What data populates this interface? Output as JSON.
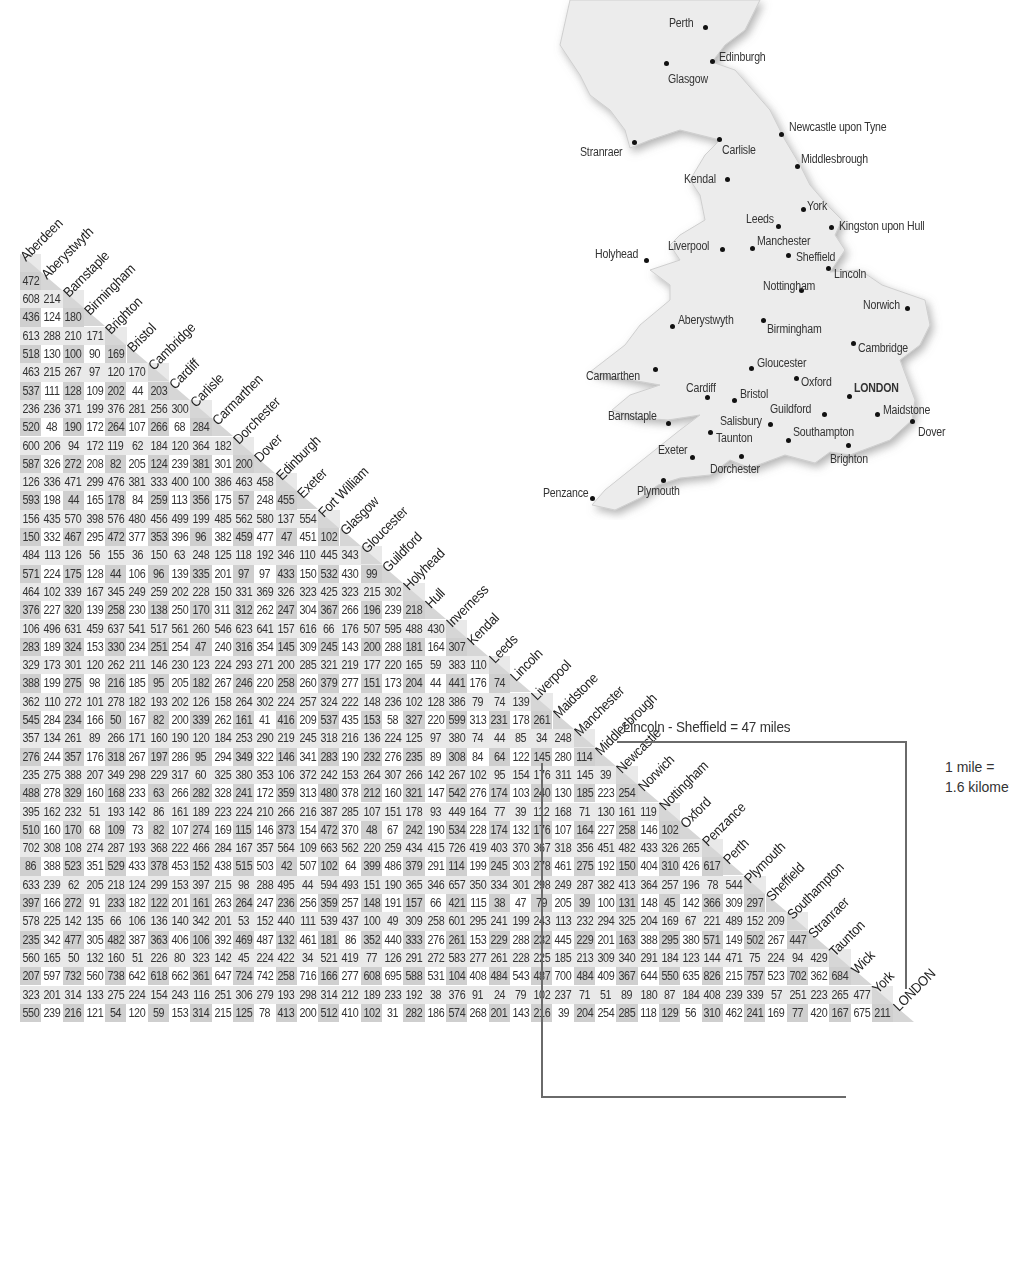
{
  "map": {
    "towns": [
      {
        "name": "Perth",
        "x": 669,
        "y": 16,
        "dx": 705,
        "dy": 27
      },
      {
        "name": "Edinburgh",
        "x": 719,
        "y": 50,
        "dx": 712,
        "dy": 61
      },
      {
        "name": "Glasgow",
        "x": 668,
        "y": 72,
        "dx": 666,
        "dy": 63
      },
      {
        "name": "Newcastle upon Tyne",
        "x": 789,
        "y": 120,
        "dx": 781,
        "dy": 134
      },
      {
        "name": "Stranraer",
        "x": 580,
        "y": 145,
        "dx": 634,
        "dy": 142
      },
      {
        "name": "Carlisle",
        "x": 722,
        "y": 143,
        "dx": 719,
        "dy": 139
      },
      {
        "name": "Middlesbrough",
        "x": 801,
        "y": 152,
        "dx": 797,
        "dy": 166
      },
      {
        "name": "Kendal",
        "x": 684,
        "y": 172,
        "dx": 727,
        "dy": 179
      },
      {
        "name": "York",
        "x": 807,
        "y": 199,
        "dx": 803,
        "dy": 209
      },
      {
        "name": "Leeds",
        "x": 746,
        "y": 212,
        "dx": 778,
        "dy": 226
      },
      {
        "name": "Kingston upon Hull",
        "x": 839,
        "y": 219,
        "dx": 831,
        "dy": 227
      },
      {
        "name": "Manchester",
        "x": 757,
        "y": 234,
        "dx": 752,
        "dy": 248
      },
      {
        "name": "Liverpool",
        "x": 668,
        "y": 239,
        "dx": 722,
        "dy": 249
      },
      {
        "name": "Holyhead",
        "x": 595,
        "y": 247,
        "dx": 646,
        "dy": 260
      },
      {
        "name": "Sheffield",
        "x": 796,
        "y": 250,
        "dx": 788,
        "dy": 255
      },
      {
        "name": "Lincoln",
        "x": 834,
        "y": 267,
        "dx": 828,
        "dy": 268
      },
      {
        "name": "Nottingham",
        "x": 763,
        "y": 279,
        "dx": 801,
        "dy": 290
      },
      {
        "name": "Norwich",
        "x": 863,
        "y": 298,
        "dx": 907,
        "dy": 308
      },
      {
        "name": "Aberystwyth",
        "x": 678,
        "y": 313,
        "dx": 672,
        "dy": 326
      },
      {
        "name": "Birmingham",
        "x": 767,
        "y": 322,
        "dx": 763,
        "dy": 320
      },
      {
        "name": "Cambridge",
        "x": 858,
        "y": 341,
        "dx": 853,
        "dy": 343
      },
      {
        "name": "Gloucester",
        "x": 757,
        "y": 356,
        "dx": 751,
        "dy": 368
      },
      {
        "name": "Carmarthen",
        "x": 586,
        "y": 369,
        "dx": 655,
        "dy": 369
      },
      {
        "name": "Oxford",
        "x": 801,
        "y": 375,
        "dx": 796,
        "dy": 378
      },
      {
        "name": "LONDON",
        "x": 854,
        "y": 381,
        "dx": 849,
        "dy": 396,
        "capital": true
      },
      {
        "name": "Cardiff",
        "x": 686,
        "y": 381,
        "dx": 707,
        "dy": 397
      },
      {
        "name": "Bristol",
        "x": 740,
        "y": 387,
        "dx": 734,
        "dy": 400
      },
      {
        "name": "Maidstone",
        "x": 883,
        "y": 403,
        "dx": 877,
        "dy": 414
      },
      {
        "name": "Guildford",
        "x": 770,
        "y": 402,
        "dx": 824,
        "dy": 414
      },
      {
        "name": "Barnstaple",
        "x": 608,
        "y": 409,
        "dx": 668,
        "dy": 423
      },
      {
        "name": "Salisbury",
        "x": 720,
        "y": 414,
        "dx": 770,
        "dy": 424
      },
      {
        "name": "Dover",
        "x": 918,
        "y": 425,
        "dx": 912,
        "dy": 421
      },
      {
        "name": "Taunton",
        "x": 716,
        "y": 431,
        "dx": 710,
        "dy": 432
      },
      {
        "name": "Southampton",
        "x": 793,
        "y": 425,
        "dx": 788,
        "dy": 440
      },
      {
        "name": "Exeter",
        "x": 658,
        "y": 443,
        "dx": 692,
        "dy": 457
      },
      {
        "name": "Brighton",
        "x": 830,
        "y": 452,
        "dx": 848,
        "dy": 445
      },
      {
        "name": "Dorchester",
        "x": 710,
        "y": 462,
        "dx": 741,
        "dy": 456
      },
      {
        "name": "Penzance",
        "x": 543,
        "y": 486,
        "dx": 592,
        "dy": 498
      },
      {
        "name": "Plymouth",
        "x": 637,
        "y": 484,
        "dx": 663,
        "dy": 480
      }
    ]
  },
  "table": {
    "cities": [
      "Aberdeen",
      "Aberystwyth",
      "Barnstaple",
      "Birmingham",
      "Brighton",
      "Bristol",
      "Cambridge",
      "Cardiff",
      "Carlisle",
      "Carmarthen",
      "Dorchester",
      "Dover",
      "Edinburgh",
      "Exeter",
      "Fort William",
      "Glasgow",
      "Gloucester",
      "Guildford",
      "Holyhead",
      "Hull",
      "Inverness",
      "Kendal",
      "Leeds",
      "Lincoln",
      "Liverpool",
      "Maidstone",
      "Manchester",
      "Middlesbrough",
      "Newcastle",
      "Norwich",
      "Nottingham",
      "Oxford",
      "Penzance",
      "Perth",
      "Plymouth",
      "Sheffield",
      "Southampton",
      "Stranraer",
      "Taunton",
      "Wick",
      "York",
      "LONDON"
    ],
    "rows": [
      [
        472
      ],
      [
        608,
        214
      ],
      [
        436,
        124,
        180
      ],
      [
        613,
        288,
        210,
        171
      ],
      [
        518,
        130,
        100,
        90,
        169
      ],
      [
        463,
        215,
        267,
        97,
        120,
        170
      ],
      [
        537,
        111,
        128,
        109,
        202,
        44,
        203
      ],
      [
        236,
        236,
        371,
        199,
        376,
        281,
        256,
        300
      ],
      [
        520,
        48,
        190,
        172,
        264,
        107,
        266,
        68,
        284
      ],
      [
        600,
        206,
        94,
        172,
        119,
        62,
        184,
        120,
        364,
        182
      ],
      [
        587,
        326,
        272,
        208,
        82,
        205,
        124,
        239,
        381,
        301,
        200
      ],
      [
        126,
        336,
        471,
        299,
        476,
        381,
        333,
        400,
        100,
        386,
        463,
        458
      ],
      [
        593,
        198,
        44,
        165,
        178,
        84,
        259,
        113,
        356,
        175,
        57,
        248,
        455
      ],
      [
        156,
        435,
        570,
        398,
        576,
        480,
        456,
        499,
        199,
        485,
        562,
        580,
        137,
        554
      ],
      [
        150,
        332,
        467,
        295,
        472,
        377,
        353,
        396,
        96,
        382,
        459,
        477,
        47,
        451,
        102
      ],
      [
        484,
        113,
        126,
        56,
        155,
        36,
        150,
        63,
        248,
        125,
        118,
        192,
        346,
        110,
        445,
        343
      ],
      [
        571,
        224,
        175,
        128,
        44,
        106,
        96,
        139,
        335,
        201,
        97,
        97,
        433,
        150,
        532,
        430,
        99
      ],
      [
        464,
        102,
        339,
        167,
        345,
        249,
        259,
        202,
        228,
        150,
        331,
        369,
        326,
        323,
        425,
        323,
        215,
        302
      ],
      [
        376,
        227,
        320,
        139,
        258,
        230,
        138,
        250,
        170,
        311,
        312,
        262,
        247,
        304,
        367,
        266,
        196,
        239,
        218
      ],
      [
        106,
        496,
        631,
        459,
        637,
        541,
        517,
        561,
        260,
        546,
        623,
        641,
        157,
        616,
        66,
        176,
        507,
        595,
        488,
        430
      ],
      [
        283,
        189,
        324,
        153,
        330,
        234,
        251,
        254,
        47,
        240,
        316,
        354,
        145,
        309,
        245,
        143,
        200,
        288,
        181,
        164,
        307
      ],
      [
        329,
        173,
        301,
        120,
        262,
        211,
        146,
        230,
        123,
        224,
        293,
        271,
        200,
        285,
        321,
        219,
        177,
        220,
        165,
        59,
        383,
        110
      ],
      [
        388,
        199,
        275,
        98,
        216,
        185,
        95,
        205,
        182,
        267,
        246,
        220,
        258,
        260,
        379,
        277,
        151,
        173,
        204,
        44,
        441,
        176,
        74
      ],
      [
        362,
        110,
        272,
        101,
        278,
        182,
        193,
        202,
        126,
        158,
        264,
        302,
        224,
        257,
        324,
        222,
        148,
        236,
        102,
        128,
        386,
        79,
        74,
        139
      ],
      [
        545,
        284,
        234,
        166,
        50,
        167,
        82,
        200,
        339,
        262,
        161,
        41,
        416,
        209,
        537,
        435,
        153,
        58,
        327,
        220,
        599,
        313,
        231,
        178,
        261
      ],
      [
        357,
        134,
        261,
        89,
        266,
        171,
        160,
        190,
        120,
        184,
        253,
        290,
        219,
        245,
        318,
        216,
        136,
        224,
        125,
        97,
        380,
        74,
        44,
        85,
        34,
        248
      ],
      [
        276,
        244,
        357,
        176,
        318,
        267,
        197,
        286,
        95,
        294,
        349,
        322,
        146,
        341,
        283,
        190,
        232,
        276,
        235,
        89,
        308,
        84,
        64,
        122,
        145,
        280,
        114
      ],
      [
        235,
        275,
        388,
        207,
        349,
        298,
        229,
        317,
        60,
        325,
        380,
        353,
        106,
        372,
        242,
        153,
        264,
        307,
        266,
        142,
        267,
        102,
        95,
        154,
        176,
        311,
        145,
        39
      ],
      [
        488,
        278,
        329,
        160,
        168,
        233,
        63,
        266,
        282,
        328,
        241,
        172,
        359,
        313,
        480,
        378,
        212,
        160,
        321,
        147,
        542,
        276,
        174,
        103,
        240,
        130,
        185,
        223,
        254
      ],
      [
        395,
        162,
        232,
        51,
        193,
        142,
        86,
        161,
        189,
        223,
        224,
        210,
        266,
        216,
        387,
        285,
        107,
        151,
        178,
        93,
        449,
        164,
        77,
        39,
        112,
        168,
        71,
        130,
        161,
        119
      ],
      [
        510,
        160,
        170,
        68,
        109,
        73,
        82,
        107,
        274,
        169,
        115,
        146,
        373,
        154,
        472,
        370,
        48,
        67,
        242,
        190,
        534,
        228,
        174,
        132,
        176,
        107,
        164,
        227,
        258,
        146,
        102
      ],
      [
        702,
        308,
        108,
        274,
        287,
        193,
        368,
        222,
        466,
        284,
        167,
        357,
        564,
        109,
        663,
        562,
        220,
        259,
        434,
        415,
        726,
        419,
        403,
        370,
        367,
        318,
        356,
        451,
        482,
        433,
        326,
        265
      ],
      [
        86,
        388,
        523,
        351,
        529,
        433,
        378,
        453,
        152,
        438,
        515,
        503,
        42,
        507,
        102,
        64,
        399,
        486,
        379,
        291,
        114,
        199,
        245,
        303,
        278,
        461,
        275,
        192,
        150,
        404,
        310,
        426,
        617
      ],
      [
        633,
        239,
        62,
        205,
        218,
        124,
        299,
        153,
        397,
        215,
        98,
        288,
        495,
        44,
        594,
        493,
        151,
        190,
        365,
        346,
        657,
        350,
        334,
        301,
        298,
        249,
        287,
        382,
        413,
        364,
        257,
        196,
        78,
        544
      ],
      [
        397,
        166,
        272,
        91,
        233,
        182,
        122,
        201,
        161,
        263,
        264,
        247,
        236,
        256,
        359,
        257,
        148,
        191,
        157,
        66,
        421,
        115,
        38,
        47,
        79,
        205,
        39,
        100,
        131,
        148,
        45,
        142,
        366,
        309,
        297
      ],
      [
        578,
        225,
        142,
        135,
        66,
        106,
        136,
        140,
        342,
        201,
        53,
        152,
        440,
        111,
        539,
        437,
        100,
        49,
        309,
        258,
        601,
        295,
        241,
        199,
        243,
        113,
        232,
        294,
        325,
        204,
        169,
        67,
        221,
        489,
        152,
        209
      ],
      [
        235,
        342,
        477,
        305,
        482,
        387,
        363,
        406,
        106,
        392,
        469,
        487,
        132,
        461,
        181,
        86,
        352,
        440,
        333,
        276,
        261,
        153,
        229,
        288,
        232,
        445,
        229,
        201,
        163,
        388,
        295,
        380,
        571,
        149,
        502,
        267,
        447
      ],
      [
        560,
        165,
        50,
        132,
        160,
        51,
        226,
        80,
        323,
        142,
        45,
        224,
        422,
        34,
        521,
        419,
        77,
        126,
        291,
        272,
        583,
        277,
        261,
        228,
        225,
        185,
        213,
        309,
        340,
        291,
        184,
        123,
        144,
        471,
        75,
        224,
        94,
        429
      ],
      [
        207,
        597,
        732,
        560,
        738,
        642,
        618,
        662,
        361,
        647,
        724,
        742,
        258,
        716,
        166,
        277,
        608,
        695,
        588,
        531,
        104,
        408,
        484,
        543,
        487,
        700,
        484,
        409,
        367,
        644,
        550,
        635,
        826,
        215,
        757,
        523,
        702,
        362,
        684
      ],
      [
        323,
        201,
        314,
        133,
        275,
        224,
        154,
        243,
        116,
        251,
        306,
        279,
        193,
        298,
        314,
        212,
        189,
        233,
        192,
        38,
        376,
        91,
        24,
        79,
        102,
        237,
        71,
        51,
        89,
        180,
        87,
        184,
        408,
        239,
        339,
        57,
        251,
        223,
        265,
        477
      ],
      [
        550,
        239,
        216,
        121,
        54,
        120,
        59,
        153,
        314,
        215,
        125,
        78,
        413,
        200,
        512,
        410,
        102,
        31,
        282,
        186,
        574,
        268,
        201,
        143,
        216,
        39,
        204,
        254,
        285,
        118,
        129,
        56,
        310,
        462,
        241,
        169,
        77,
        420,
        167,
        675,
        211
      ]
    ]
  },
  "legend": {
    "example": "Lincoln - Sheffield = 47 miles",
    "conversion_line1": "1 mile =",
    "conversion_line2": "1.6 kilometres"
  },
  "colors": {
    "row_shade": "#e9e9e9",
    "col_shade": "#cfcfcf",
    "diag_shade": "#d6d6d6",
    "bracket": "#6a6a6a",
    "land": "#ececec"
  }
}
